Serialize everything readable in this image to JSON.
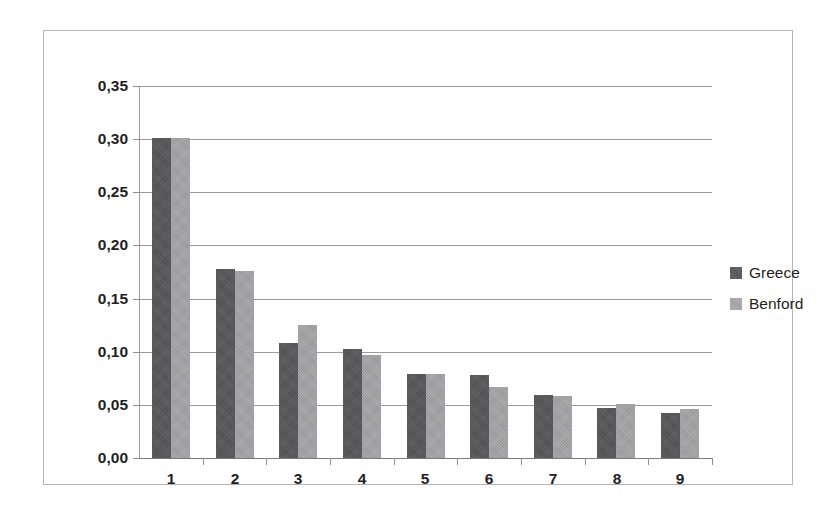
{
  "chart_data": {
    "type": "bar",
    "title": "",
    "subtitle": "",
    "xlabel": "",
    "ylabel": "",
    "categories": [
      "1",
      "2",
      "3",
      "4",
      "5",
      "6",
      "7",
      "8",
      "9"
    ],
    "series": [
      {
        "name": "Greece",
        "color": "#58585a",
        "values": [
          0.301,
          0.178,
          0.108,
          0.103,
          0.079,
          0.078,
          0.059,
          0.047,
          0.042
        ]
      },
      {
        "name": "Benford",
        "color": "#a2a2a4",
        "values": [
          0.301,
          0.176,
          0.125,
          0.097,
          0.079,
          0.067,
          0.058,
          0.051,
          0.046
        ]
      }
    ],
    "ylim": [
      0.0,
      0.35
    ],
    "ytick_step": 0.05,
    "ytick_labels": [
      "0,00",
      "0,05",
      "0,10",
      "0,15",
      "0,20",
      "0,25",
      "0,30",
      "0,35"
    ],
    "ytick_values": [
      0.0,
      0.05,
      0.1,
      0.15,
      0.2,
      0.25,
      0.3,
      0.35
    ],
    "xtick_labels": [
      "1",
      "2",
      "3",
      "4",
      "5",
      "6",
      "7",
      "8",
      "9"
    ],
    "grid": "horizontal",
    "legend_position": "right",
    "legend_entries": [
      "Greece",
      "Benford"
    ],
    "decimal_separator": ","
  },
  "colors": {
    "greece": "#58585a",
    "benford": "#a2a2a4",
    "gridline": "#9b9b9b",
    "axis": "#8f8f8f",
    "frame": "#b4b4b4",
    "text": "#231f20",
    "background": "#ffffff"
  }
}
